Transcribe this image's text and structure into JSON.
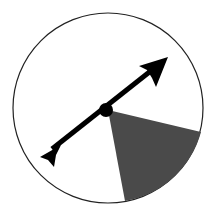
{
  "spinner": {
    "center": [
      108,
      108
    ],
    "radius": 95,
    "background_color": "#ffffff",
    "outline_color": "#222222",
    "shaded_sector": {
      "color": "#4a4a4a",
      "start_point": [
        201,
        132
      ],
      "end_point": [
        125,
        201
      ]
    },
    "arrow": {
      "color": "#000000",
      "tip": [
        168,
        57
      ],
      "tail": [
        40,
        157
      ],
      "hub_radius": 7
    }
  }
}
